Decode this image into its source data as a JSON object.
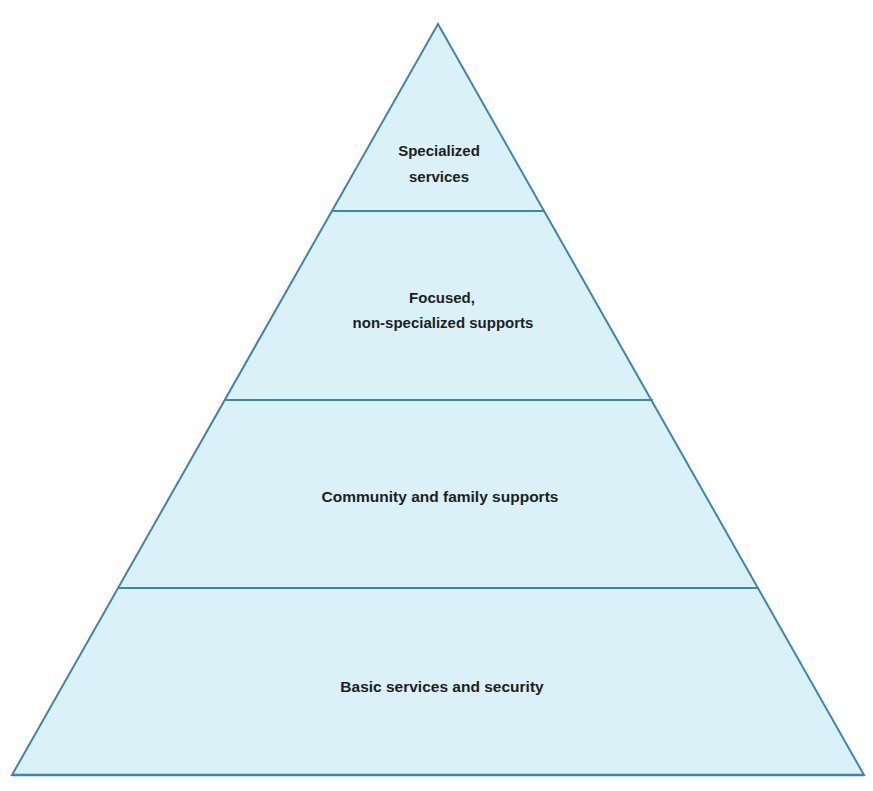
{
  "diagram": {
    "type": "pyramid",
    "colors": {
      "fill": "#d9f1f7",
      "stroke": "#3f87a9",
      "text": "#1e1e1e",
      "background": "#ffffff"
    },
    "tiers": [
      {
        "level": 4,
        "position": "top",
        "lines": [
          "Specialized",
          "services"
        ]
      },
      {
        "level": 3,
        "position": "upper-middle",
        "lines": [
          "Focused,",
          "non-specialized supports"
        ]
      },
      {
        "level": 2,
        "position": "lower-middle",
        "lines": [
          "Community and family supports"
        ]
      },
      {
        "level": 1,
        "position": "base",
        "lines": [
          "Basic services and security"
        ]
      }
    ]
  }
}
